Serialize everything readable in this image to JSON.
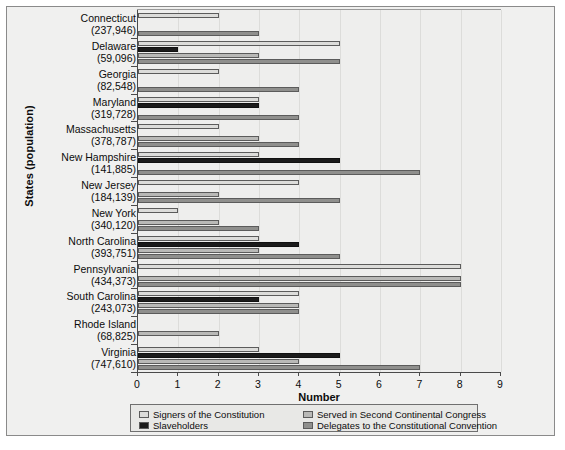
{
  "chart_data": {
    "type": "bar",
    "orientation": "horizontal",
    "title": "",
    "xlabel": "Number",
    "ylabel": "States (population)",
    "xlim": [
      0,
      9
    ],
    "xticks": [
      0,
      1,
      2,
      3,
      4,
      5,
      6,
      7,
      8,
      9
    ],
    "grid": true,
    "legend_position": "bottom",
    "categories": [
      "Connecticut (237,946)",
      "Delaware (59,096)",
      "Georgia (82,548)",
      "Maryland (319,728)",
      "Massachusetts (378,787)",
      "New Hampshire (141,885)",
      "New Jersey (184,139)",
      "New York (340,120)",
      "North Carolina (393,751)",
      "Pennsylvania (434,373)",
      "South Carolina (243,073)",
      "Rhode Island (68,825)",
      "Virginia (747,610)"
    ],
    "category_names": [
      "Connecticut",
      "Delaware",
      "Georgia",
      "Maryland",
      "Massachusetts",
      "New Hampshire",
      "New Jersey",
      "New York",
      "North Carolina",
      "Pennsylvania",
      "South Carolina",
      "Rhode Island",
      "Virginia"
    ],
    "category_populations": [
      "(237,946)",
      "(59,096)",
      "(82,548)",
      "(319,728)",
      "(378,787)",
      "(141,885)",
      "(184,139)",
      "(340,120)",
      "(393,751)",
      "(434,373)",
      "(243,073)",
      "(68,825)",
      "(747,610)"
    ],
    "series": [
      {
        "name": "Signers of the Constitution",
        "color": "#dcdcda",
        "values": [
          2,
          5,
          2,
          3,
          2,
          3,
          4,
          1,
          3,
          8,
          4,
          0,
          3
        ]
      },
      {
        "name": "Slaveholders",
        "color": "#1b1b1b",
        "values": [
          0,
          1,
          0,
          3,
          0,
          5,
          0,
          0,
          4,
          0,
          3,
          0,
          5
        ]
      },
      {
        "name": "Served in Second Continental Congress",
        "color": "#b9b9b7",
        "values": [
          0,
          3,
          0,
          0,
          3,
          0,
          2,
          2,
          3,
          8,
          4,
          2,
          4
        ]
      },
      {
        "name": "Delegates to the Constitutional Convention",
        "color": "#8f8f8d",
        "values": [
          3,
          5,
          4,
          4,
          4,
          7,
          5,
          3,
          5,
          8,
          4,
          0,
          7
        ]
      }
    ]
  },
  "axis": {
    "x_title": "Number",
    "y_title": "States (population)",
    "x_tick_labels": [
      "0",
      "1",
      "2",
      "3",
      "4",
      "5",
      "6",
      "7",
      "8",
      "9"
    ]
  },
  "legend": {
    "entries": [
      {
        "label": "Signers of the Constitution",
        "swatch": "#dcdcda"
      },
      {
        "label": "Served in Second Continental Congress",
        "swatch": "#b9b9b7"
      },
      {
        "label": "Slaveholders",
        "swatch": "#1b1b1b"
      },
      {
        "label": "Delegates to the Constitutional Convention",
        "swatch": "#8f8f8d"
      }
    ]
  }
}
